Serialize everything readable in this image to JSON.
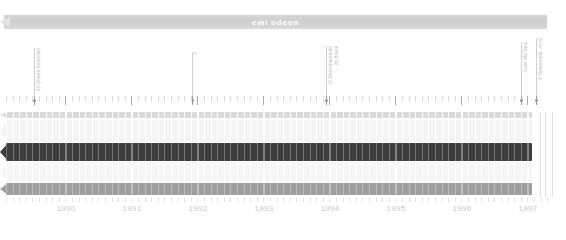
{
  "header": {
    "title": "emi odeon",
    "bar_color": "#d4d4d4",
    "text_color": "#ffffff"
  },
  "annotations": [
    {
      "label_lines": [
        "As Quatro Estações"
      ],
      "x": 34,
      "height": 52
    },
    {
      "label_lines": [
        "?"
      ],
      "x": 192,
      "height": 48
    },
    {
      "label_lines": [
        "O Descobrimento",
        "do Brasil"
      ],
      "x": 326,
      "height": 54
    },
    {
      "label_lines": [
        "Love Me Now"
      ],
      "x": 521,
      "height": 58
    },
    {
      "label_lines": [
        "A Temporada, no O"
      ],
      "x": 536,
      "height": 62
    }
  ],
  "chart_data": {
    "type": "bar",
    "title": "emi odeon",
    "xlabel": "",
    "ylabel": "",
    "grid": true,
    "legend_position": "none",
    "x_axis": {
      "tick_labels": [
        "1990",
        "1991",
        "1992",
        "1993",
        "1994",
        "1995",
        "1996",
        "1997"
      ],
      "tick_positions": [
        66,
        132,
        198,
        264,
        330,
        396,
        462,
        528
      ],
      "range": [
        "1989.5",
        "1997.2"
      ]
    },
    "bands": [
      {
        "name": "band-1",
        "color": "#d9d9d9",
        "top": 0,
        "height": 6,
        "start": 6,
        "end": 532
      },
      {
        "name": "band-2",
        "color": "#f4f4f4",
        "top": 8,
        "height": 22,
        "start": 6,
        "end": 532
      },
      {
        "name": "band-3",
        "color": "#3d3d3d",
        "top": 31,
        "height": 18,
        "start": 6,
        "end": 532
      },
      {
        "name": "band-4",
        "color": "#f6f6f6",
        "top": 50,
        "height": 20,
        "start": 6,
        "end": 532
      },
      {
        "name": "band-5",
        "color": "#9e9e9e",
        "top": 71,
        "height": 12,
        "start": 6,
        "end": 532
      }
    ],
    "gridline_spacing": 6.6,
    "year_gridline_positions": [
      66,
      132,
      198,
      264,
      330,
      396,
      462,
      528
    ],
    "ruler": {
      "minor_spacing": 6.6,
      "major_positions": [
        66,
        132,
        198,
        264,
        330,
        396,
        462,
        528
      ],
      "marker_positions": [
        34,
        192,
        326,
        521,
        536
      ]
    }
  },
  "colors": {
    "background": "#ffffff",
    "dark_band": "#3d3d3d",
    "mid_band": "#9e9e9e",
    "light_band": "#f4f4f4",
    "grid": "#ffffff",
    "axis_text": "#c9c9c9",
    "label_text": "#b4b4b4"
  }
}
